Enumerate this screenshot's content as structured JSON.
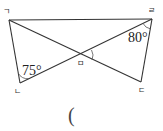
{
  "diagram": {
    "type": "geometry",
    "points": {
      "A": {
        "label": "ㄱ",
        "x": 9,
        "y": 20
      },
      "B": {
        "label": "ㄴ",
        "x": 20,
        "y": 83
      },
      "C": {
        "label": "ㄷ",
        "x": 141,
        "y": 82
      },
      "D": {
        "label": "ㄹ",
        "x": 152,
        "y": 19
      },
      "E": {
        "label": "ㅁ",
        "x": 81,
        "y": 55
      }
    },
    "segments": [
      [
        "ㄱ",
        "ㄹ"
      ],
      [
        "ㄱ",
        "ㄴ"
      ],
      [
        "ㄹ",
        "ㄷ"
      ],
      [
        "ㄱ",
        "ㄷ"
      ],
      [
        "ㄴ",
        "ㄹ"
      ]
    ],
    "angles": [
      {
        "vertex": "ㄴ",
        "value": "75°"
      },
      {
        "vertex": "ㄹ",
        "value": "80°"
      },
      {
        "vertex": "ㅁ",
        "value": "",
        "marked": true
      }
    ]
  },
  "labels": {
    "giyeok": "ㄱ",
    "nieun": "ㄴ",
    "digeut": "ㄷ",
    "rieul": "ㄹ",
    "mieum": "ㅁ",
    "angle_75": "75°",
    "angle_80": "80°"
  },
  "answer": {
    "open_paren": "("
  }
}
